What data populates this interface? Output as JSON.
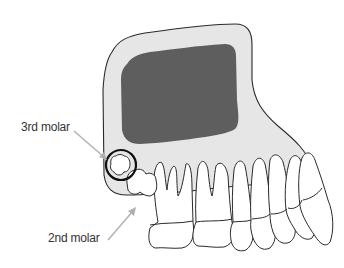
{
  "diagram": {
    "labels": {
      "third_molar": "3rd molar",
      "second_molar": "2nd molar"
    },
    "colors": {
      "bone_fill": "#e6e6e6",
      "sinus_fill": "#5e5e5e",
      "outline": "#2a2a2a",
      "tooth_fill": "#ffffff",
      "pointer_arrow": "#b0b0b0",
      "highlight_circle": "#111111",
      "label_text": "#333333"
    }
  }
}
